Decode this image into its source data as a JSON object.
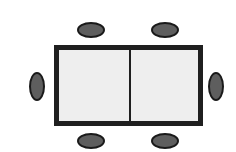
{
  "diagram": {
    "type": "seating-layout",
    "table": {
      "shape": "rectangle",
      "sections": 2,
      "fill_color": "#eeeeee",
      "border_color": "#1f1f1f"
    },
    "chairs": [
      {
        "id": "top-left",
        "side": "top"
      },
      {
        "id": "top-right",
        "side": "top"
      },
      {
        "id": "left",
        "side": "left"
      },
      {
        "id": "right",
        "side": "right"
      },
      {
        "id": "bottom-left",
        "side": "bottom"
      },
      {
        "id": "bottom-right",
        "side": "bottom"
      }
    ],
    "chair_count": 6,
    "chair_color": "#5e5e5e"
  }
}
